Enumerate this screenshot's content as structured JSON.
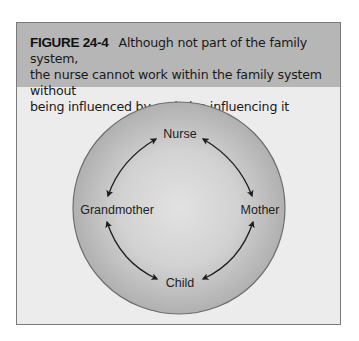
{
  "figure": {
    "label": "FIGURE 24-4",
    "caption_line1": "Although not part of the family system,",
    "caption_line2": "the nurse cannot work within the family system without",
    "caption_line3": "being influenced by and also influencing it"
  },
  "diagram": {
    "type": "circular-system",
    "nodes": {
      "top": "Nurse",
      "right": "Mother",
      "bottom": "Child",
      "left": "Grandmother"
    },
    "connections": [
      {
        "from": "Nurse",
        "to": "Grandmother",
        "arrow": "bidirectional"
      },
      {
        "from": "Nurse",
        "to": "Mother",
        "arrow": "bidirectional"
      },
      {
        "from": "Grandmother",
        "to": "Child",
        "arrow": "bidirectional"
      },
      {
        "from": "Mother",
        "to": "Child",
        "arrow": "bidirectional"
      }
    ]
  },
  "colors": {
    "header_bg": "#b6b6b6",
    "body_bg": "#ececec",
    "border": "#7a7a7a",
    "circle_center": "#dcdcdc",
    "circle_edge": "#b3b3b3",
    "circle_stroke": "#6e6e6e",
    "arrow": "#1e1e1e"
  }
}
